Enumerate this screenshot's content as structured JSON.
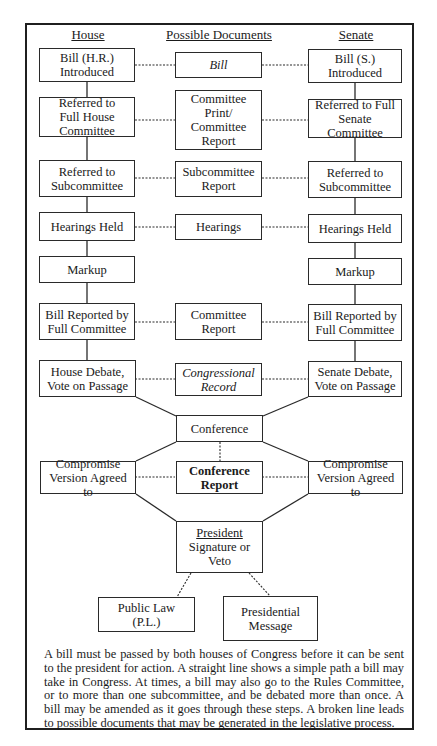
{
  "headers": {
    "house": "House",
    "documents": "Possible Documents",
    "senate": "Senate"
  },
  "house_steps": [
    {
      "line1": "Bill (H.R.)",
      "line2": "Introduced"
    },
    {
      "line1": "Referred to",
      "line2": "Full House",
      "line3": "Committee"
    },
    {
      "line1": "Referred to",
      "line2": "Subcommittee"
    },
    {
      "line1": "Hearings Held"
    },
    {
      "line1": "Markup"
    },
    {
      "line1": "Bill Reported by",
      "line2": "Full Committee"
    },
    {
      "line1": "House Debate,",
      "line2": "Vote on Passage"
    }
  ],
  "documents": [
    {
      "line1": "Bill",
      "italic": true
    },
    {
      "line1": "Committee",
      "line2": "Print/",
      "line3": "Committee",
      "line4": "Report"
    },
    {
      "line1": "Subcommittee",
      "line2": "Report"
    },
    {
      "line1": "Hearings"
    },
    {
      "line1": "Committee",
      "line2": "Report"
    },
    {
      "line1": "Congressional",
      "line2": "Record",
      "italic": true
    }
  ],
  "senate_steps": [
    {
      "line1": "Bill (S.)",
      "line2": "Introduced"
    },
    {
      "line1": "Referred to Full",
      "line2": "Senate Committee"
    },
    {
      "line1": "Referred to",
      "line2": "Subcommittee"
    },
    {
      "line1": "Hearings Held"
    },
    {
      "line1": "Markup"
    },
    {
      "line1": "Bill Reported by",
      "line2": "Full Committee"
    },
    {
      "line1": "Senate Debate,",
      "line2": "Vote on Passage"
    }
  ],
  "conference": {
    "label": "Conference"
  },
  "compromise_house": {
    "line1": "Compromise",
    "line2": "Version Agreed to"
  },
  "conference_report": {
    "line1": "Conference",
    "line2": "Report"
  },
  "compromise_senate": {
    "line1": "Compromise",
    "line2": "Version Agreed to"
  },
  "president": {
    "title": "President",
    "line1": "Signature or",
    "line2": "Veto"
  },
  "public_law": {
    "line1": "Public Law",
    "line2": "(P.L.)"
  },
  "presidential_message": {
    "line1": "Presidential",
    "line2": "Message"
  },
  "caption": "A bill must be passed by both houses of Congress before it can be sent to the president for action. A straight line shows a simple path a bill may take in Congress. At times, a bill may also go to the Rules Committee, or to more than one subcommittee, and be debated more than once. A bill may be amended as it goes through these steps.  A broken line leads to possible documents that may be generated in the legislative process."
}
